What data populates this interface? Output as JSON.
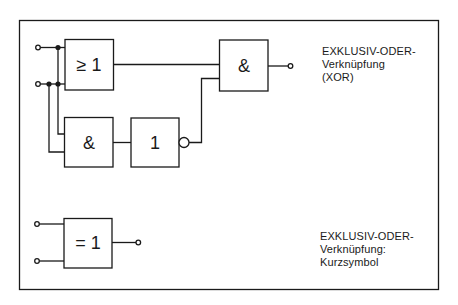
{
  "diagram": {
    "type": "logic-circuit",
    "frame_color": "#1a1a1a",
    "background": "#ffffff",
    "xor_circuit": {
      "gates": [
        {
          "id": "or_gate",
          "symbol": "≥ 1",
          "function": "OR"
        },
        {
          "id": "and_gate_lower",
          "symbol": "&",
          "function": "AND"
        },
        {
          "id": "not_gate",
          "symbol": "1",
          "function": "NOT",
          "inverted_output": true
        },
        {
          "id": "and_gate_output",
          "symbol": "&",
          "function": "AND"
        }
      ],
      "inputs": 2,
      "outputs": 1,
      "caption": [
        "EXKLUSIV-ODER-",
        "Verknüpfung",
        "(XOR)"
      ]
    },
    "xor_short_symbol": {
      "gates": [
        {
          "id": "xor_gate",
          "symbol": "= 1",
          "function": "XOR"
        }
      ],
      "inputs": 2,
      "outputs": 1,
      "caption": [
        "EXKLUSIV-ODER-",
        "Verknüpfung:",
        "Kurzsymbol"
      ]
    }
  }
}
